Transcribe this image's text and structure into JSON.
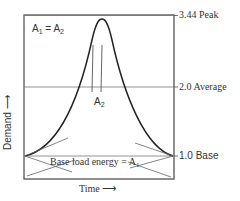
{
  "diagram": {
    "title_equation": {
      "left": "A",
      "left_sub": "1",
      "eq": " = ",
      "right": "A",
      "right_sub": "2"
    },
    "levels": [
      {
        "value": "3.44",
        "label": "Peak",
        "text": "3.44 Peak"
      },
      {
        "value": "2.0",
        "label": "Average",
        "text": "2.0 Average"
      },
      {
        "value": "1.0",
        "label": "Base",
        "text": "1.0 Base"
      }
    ],
    "area_label": {
      "main": "A",
      "sub": "2"
    },
    "base_energy": {
      "text": "Base load energy = ",
      "main": "A",
      "sub": "1"
    },
    "x_axis": {
      "label": "Time",
      "arrow": "⟶"
    },
    "y_axis": {
      "label": "Demand",
      "arrow": "⟶"
    }
  }
}
